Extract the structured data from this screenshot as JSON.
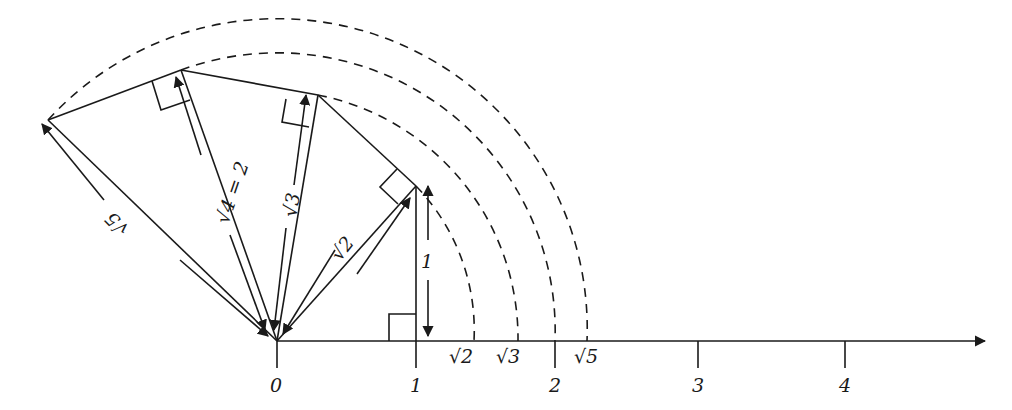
{
  "diagram": {
    "axis": {
      "tick_labels": [
        "0",
        "1",
        "2",
        "3",
        "4"
      ],
      "root_labels": [
        "√2",
        "√3",
        "√5"
      ]
    },
    "segment_labels": {
      "leg": "1",
      "hyp2": "√2",
      "hyp3": "√3",
      "hyp4": "√4 = 2",
      "hyp5": "√5"
    }
  }
}
